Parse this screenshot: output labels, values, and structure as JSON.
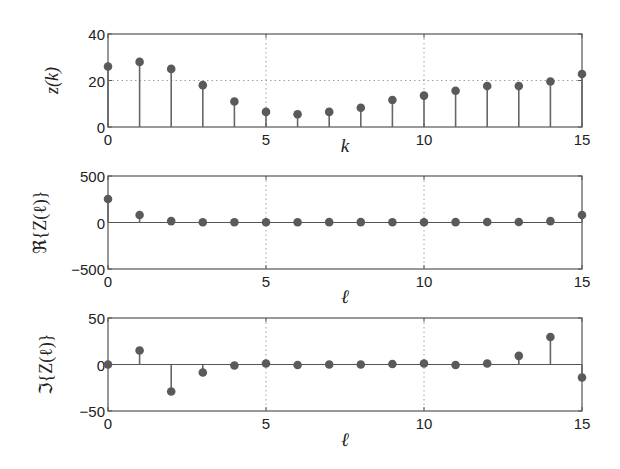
{
  "chart_data": [
    {
      "type": "stem",
      "title": "",
      "xlabel": "k",
      "ylabel": "z(k)",
      "xlim": [
        0,
        15
      ],
      "ylim": [
        0,
        40
      ],
      "xticks": [
        0,
        5,
        10,
        15
      ],
      "yticks": [
        0,
        20,
        40
      ],
      "xgrid": [
        5,
        10
      ],
      "ygrid": [
        20
      ],
      "x": [
        0,
        1,
        2,
        3,
        4,
        5,
        6,
        7,
        8,
        9,
        10,
        11,
        12,
        13,
        14,
        15
      ],
      "values": [
        26,
        28,
        25,
        18,
        11,
        6.5,
        5.5,
        6.5,
        8.3,
        11.6,
        13.5,
        15.6,
        17.6,
        17.6,
        19.6,
        22.8
      ]
    },
    {
      "type": "stem",
      "title": "",
      "xlabel": "ℓ",
      "ylabel": "ℜ{Z(ℓ)}",
      "xlim": [
        0,
        15
      ],
      "ylim": [
        -500,
        500
      ],
      "xticks": [
        0,
        5,
        10,
        15
      ],
      "yticks": [
        -500,
        0,
        500
      ],
      "xgrid": [
        5,
        10
      ],
      "ygrid": [],
      "x": [
        0,
        1,
        2,
        3,
        4,
        5,
        6,
        7,
        8,
        9,
        10,
        11,
        12,
        13,
        14,
        15
      ],
      "values": [
        253,
        80,
        15,
        2,
        3,
        3,
        3,
        4,
        4,
        3,
        3,
        4,
        5,
        5,
        15,
        80
      ]
    },
    {
      "type": "stem",
      "title": "",
      "xlabel": "ℓ",
      "ylabel": "ℑ{Z(ℓ)}",
      "xlim": [
        0,
        15
      ],
      "ylim": [
        -50,
        50
      ],
      "xticks": [
        0,
        5,
        10,
        15
      ],
      "yticks": [
        -50,
        0,
        50
      ],
      "xgrid": [
        5,
        10
      ],
      "ygrid": [],
      "x": [
        0,
        1,
        2,
        3,
        4,
        5,
        6,
        7,
        8,
        9,
        10,
        11,
        12,
        13,
        14,
        15
      ],
      "values": [
        0,
        15,
        -29,
        -8.6,
        -1,
        1,
        -0.5,
        0,
        0,
        0.5,
        1,
        -0.5,
        1,
        9.3,
        29.5,
        -14
      ]
    }
  ],
  "layout": {
    "panels": [
      {
        "left": 108,
        "right": 582,
        "top": 34,
        "bottom": 127,
        "xlabel_y": 152,
        "ylabel_x": 58
      },
      {
        "left": 108,
        "right": 582,
        "top": 176,
        "bottom": 269,
        "xlabel_y": 303,
        "ylabel_x": 46
      },
      {
        "left": 108,
        "right": 582,
        "top": 318,
        "bottom": 411,
        "xlabel_y": 446,
        "ylabel_x": 52
      }
    ]
  },
  "colors": {
    "marker": "#5a5a5a",
    "stem": "#666666",
    "frame": "#555555",
    "grid": "#888888"
  }
}
